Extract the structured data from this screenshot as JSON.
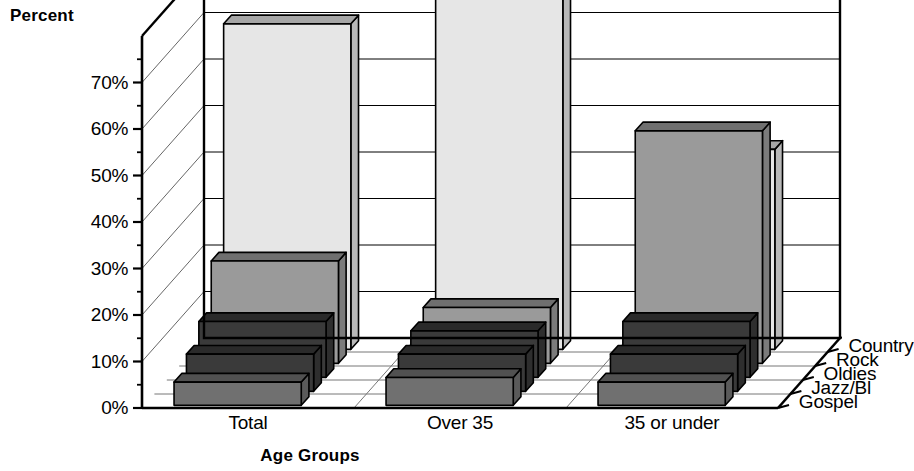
{
  "chart_data": {
    "type": "bar",
    "title": "",
    "ylabel": "Percent",
    "xlabel": "Age Groups",
    "ylim": [
      0,
      80
    ],
    "ytick_labels": [
      "0%",
      "10%",
      "20%",
      "30%",
      "40%",
      "50%",
      "60%",
      "70%"
    ],
    "ytick_values": [
      0,
      10,
      20,
      30,
      40,
      50,
      60,
      70
    ],
    "grid": true,
    "legend_position": "right-depth-axis",
    "projection": "3d",
    "categories": [
      "Total",
      "Over 35",
      "35 or under"
    ],
    "series": [
      {
        "name": "Gospel",
        "color": "#707070",
        "values": [
          5,
          6,
          5
        ]
      },
      {
        "name": "Jazz/Bl",
        "color": "#3a3a3a",
        "values": [
          8,
          8,
          8
        ]
      },
      {
        "name": "Oldies",
        "color": "#3a3a3a",
        "values": [
          12,
          10,
          12
        ]
      },
      {
        "name": "Rock",
        "color": "#9a9a9a",
        "values": [
          22,
          12,
          50
        ]
      },
      {
        "name": "Country",
        "color": "#e6e6e6",
        "values": [
          70,
          78,
          43
        ]
      }
    ],
    "legend_entries": [
      "Country",
      "Rock",
      "Oldies",
      "Jazz/Bl",
      "Gospel"
    ]
  },
  "labels": {
    "percent_axis_title": "Percent",
    "age_groups_axis_title": "Age Groups"
  }
}
